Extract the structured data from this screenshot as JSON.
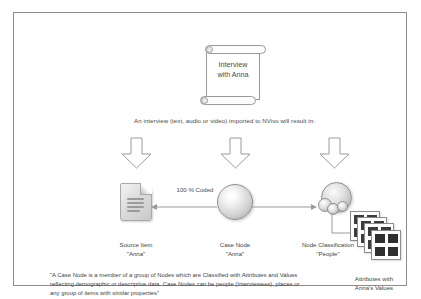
{
  "diagram": {
    "title_document": {
      "icon": "scroll-icon",
      "line1": "Interview",
      "line2": "with Anna"
    },
    "lead_caption": "An interview (text, audio or video) imported to NVivo will result in:",
    "arrows": [
      {
        "name": "down-arrow-left"
      },
      {
        "name": "down-arrow-center"
      },
      {
        "name": "down-arrow-right"
      }
    ],
    "nodes": [
      {
        "icon": "document-icon",
        "label": "Source Item",
        "value": "\"Anna\""
      },
      {
        "icon": "sphere-node-icon",
        "label": "Case Node",
        "value": "\"Anna\""
      },
      {
        "icon": "node-classification-icon",
        "label": "Node Classification",
        "value": "\"People\""
      }
    ],
    "connector_label": "100 % Coded",
    "attributes": {
      "icon": "attribute-grid-stack-icon",
      "line1": "Attributes with",
      "line2": "Anna's Values"
    },
    "quote": "\"A Case Node is a member of a group of Nodes which are Classified with Attributes and Values reflecting demographic or descriptive data. Case Nodes can be people (Interviewees), places or any group of items with similar properties\""
  },
  "colors": {
    "border": "#8d8d8d",
    "text": "#3f3f3f",
    "icon_outline": "#8f8f8f",
    "background": "#ffffff"
  }
}
